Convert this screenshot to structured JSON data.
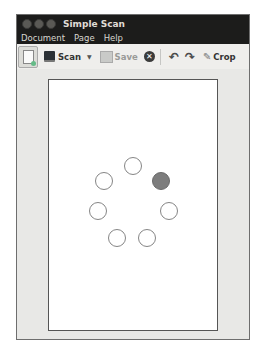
{
  "window": {
    "title": "Simple Scan",
    "controls": [
      "close",
      "minimize",
      "maximize"
    ]
  },
  "menubar": {
    "items": [
      {
        "label": "Document"
      },
      {
        "label": "Page"
      },
      {
        "label": "Help"
      }
    ]
  },
  "toolbar": {
    "new_document_icon": "document-new-icon",
    "scan_label": "Scan",
    "scan_dropdown_icon": "chevron-down-icon",
    "save_label": "Save",
    "stop_icon": "stop-icon",
    "rotate_left_icon": "rotate-left-icon",
    "rotate_right_icon": "rotate-right-icon",
    "crop_label": "Crop",
    "stop_glyph": "✕",
    "rotate_left_glyph": "↶",
    "rotate_right_glyph": "↷",
    "crop_glyph": "✎",
    "dropdown_glyph": "▼"
  },
  "canvas": {
    "page_state": "scanning",
    "spinner": {
      "dot_count": 7,
      "active_index": 1,
      "active_color": "#7d7d7d",
      "inactive_color": "#ffffff"
    }
  }
}
